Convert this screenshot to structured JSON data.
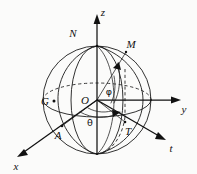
{
  "figure": {
    "type": "geometry-diagram",
    "background_color": "#fbfbfa",
    "line_color": "#1b1b1b"
  },
  "axes": [
    {
      "id": "z",
      "label": "z",
      "direction": "up",
      "label_x": 103,
      "label_y": 14
    },
    {
      "id": "y",
      "label": "y",
      "direction": "right",
      "label_x": 183,
      "label_y": 111
    },
    {
      "id": "x",
      "label": "x",
      "direction": "down-left",
      "label_x": 15,
      "label_y": 168
    },
    {
      "id": "t",
      "label": "t",
      "direction": "down-right",
      "label_x": 170,
      "label_y": 150
    }
  ],
  "points": [
    {
      "id": "N",
      "label": "N",
      "label_x": 73,
      "label_y": 33,
      "marker": false
    },
    {
      "id": "M",
      "label": "M",
      "label_x": 129,
      "label_y": 45,
      "marker": false
    },
    {
      "id": "G",
      "label": "G",
      "label_x": 45,
      "label_y": 105,
      "marker": true
    },
    {
      "id": "O",
      "label": "O",
      "label_x": 78,
      "label_y": 104,
      "marker": false
    },
    {
      "id": "A",
      "label": "A",
      "label_x": 57,
      "label_y": 137,
      "marker": false
    },
    {
      "id": "T",
      "label": "T",
      "label_x": 127,
      "label_y": 133,
      "marker": false
    }
  ],
  "angles": [
    {
      "id": "phi",
      "label": "φ",
      "label_x": 109,
      "label_y": 94,
      "description": "elevation angle from equatorial plane to OM"
    },
    {
      "id": "theta",
      "label": "θ",
      "label_x": 90,
      "label_y": 125,
      "description": "azimuthal angle in equatorial plane"
    }
  ]
}
